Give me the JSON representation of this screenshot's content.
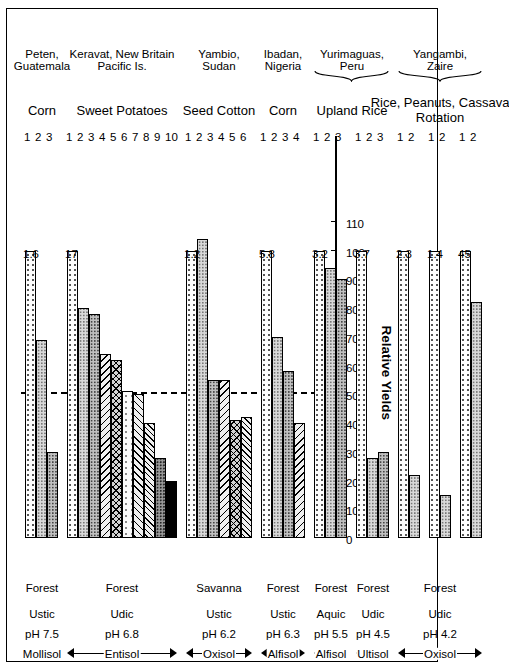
{
  "chart_data": {
    "type": "bar",
    "title": "",
    "xlabel": "",
    "ylabel": "Relative Yields",
    "ylim": [
      0,
      110
    ],
    "yticks": [
      0,
      10,
      20,
      30,
      40,
      50,
      60,
      70,
      80,
      90,
      100,
      110
    ],
    "grid": false,
    "legend": "none",
    "orientation": "rotated-90-ccw",
    "reference_line": {
      "value": 50,
      "style": "dashed",
      "label": ""
    },
    "groups": [
      {
        "crop": "Corn",
        "site": "Peten,\nGuatemala",
        "site_line1": "Peten,",
        "site_line2": "Guatemala",
        "first_crop_yield": "1.6",
        "categories": [
          "1",
          "2",
          "3"
        ],
        "values": [
          100,
          69,
          30
        ],
        "patterns": [
          "dots",
          "grey1",
          "grey2"
        ],
        "soil": {
          "name": "Mollisol",
          "ph": "pH 7.5",
          "moisture": "Ustic",
          "vegetation": "Forest"
        }
      },
      {
        "crop": "Sweet Potatoes",
        "site": "Keravat, New Britain\nPacific Is.",
        "site_line1": "Keravat, New Britain",
        "site_line2": "Pacific Is.",
        "first_crop_yield": "17",
        "categories": [
          "1",
          "2",
          "3",
          "4",
          "5",
          "6",
          "7",
          "8",
          "9",
          "10"
        ],
        "values": [
          100,
          80,
          78,
          64,
          62,
          51,
          50,
          40,
          28,
          20
        ],
        "patterns": [
          "dots",
          "grey1",
          "grey2",
          "diag",
          "cross",
          "lightdot",
          "diag2",
          "zig",
          "grey3",
          "black"
        ],
        "soil": {
          "name": "Entisol",
          "ph": "pH 6.8",
          "moisture": "Udic",
          "vegetation": "Forest"
        }
      },
      {
        "crop": "Seed Cotton",
        "site": "Yambio,\nSudan",
        "site_line1": "Yambio,",
        "site_line2": "Sudan",
        "first_crop_yield": "1.2",
        "categories": [
          "1",
          "2",
          "3",
          "4",
          "5",
          "6"
        ],
        "values": [
          100,
          104,
          55,
          55,
          41,
          42
        ],
        "patterns": [
          "dots",
          "grey1",
          "grey2",
          "diag",
          "cross",
          "zig"
        ],
        "soil": {
          "name": "Oxisol",
          "ph": "pH 6.2",
          "moisture": "Ustic",
          "vegetation": "Savanna"
        }
      },
      {
        "crop": "Corn",
        "site": "Ibadan,\nNigeria",
        "site_line1": "Ibadan,",
        "site_line2": "Nigeria",
        "first_crop_yield": "5.8",
        "categories": [
          "1",
          "2",
          "3",
          "4"
        ],
        "values": [
          100,
          70,
          58,
          40
        ],
        "patterns": [
          "dots",
          "grey1",
          "grey2",
          "diag"
        ],
        "soil": {
          "name": "Alfisol",
          "ph": "pH 6.3",
          "moisture": "Ustic",
          "vegetation": "Forest"
        }
      },
      {
        "crop": "Upland Rice",
        "site": "Yurimaguas,\nPeru",
        "site_line1": "Yurimaguas,",
        "site_line2": "Peru",
        "first_crop_yield": "3.2",
        "categories": [
          "1",
          "2",
          "3"
        ],
        "values": [
          100,
          94,
          90
        ],
        "patterns": [
          "dots",
          "grey1",
          "grey2"
        ],
        "soil": {
          "name": "Alfisol",
          "ph": "pH 5.5",
          "moisture": "Aquic",
          "vegetation": "Forest"
        }
      },
      {
        "crop": "Upland Rice",
        "site": "Yurimaguas,\nPeru",
        "site_line1": "",
        "site_line2": "",
        "first_crop_yield": "3.7",
        "categories": [
          "1",
          "2",
          "3"
        ],
        "values": [
          100,
          28,
          30
        ],
        "patterns": [
          "dots",
          "grey1",
          "grey2"
        ],
        "soil": {
          "name": "Ultisol",
          "ph": "pH 4.5",
          "moisture": "Udic",
          "vegetation": "Forest"
        }
      },
      {
        "crop": "Rice, Peanuts, Cassava Rotation",
        "site": "Yangambi,\nZaire",
        "site_line1": "Yangambi,",
        "site_line2": "Zaire",
        "first_crop_yield": "2.3",
        "categories": [
          "1",
          "2"
        ],
        "values": [
          100,
          22
        ],
        "patterns": [
          "dots",
          "grey1"
        ],
        "soil": {
          "name": "Oxisol",
          "ph": "pH 4.2",
          "moisture": "Udic",
          "vegetation": "Forest"
        }
      },
      {
        "crop": "",
        "site": "",
        "site_line1": "",
        "site_line2": "",
        "first_crop_yield": "1.4",
        "categories": [
          "1",
          "2"
        ],
        "values": [
          100,
          15
        ],
        "patterns": [
          "dots",
          "grey1"
        ],
        "soil": {
          "name": "",
          "ph": "",
          "moisture": "",
          "vegetation": ""
        }
      },
      {
        "crop": "",
        "site": "",
        "site_line1": "",
        "site_line2": "",
        "first_crop_yield": "45",
        "categories": [
          "1",
          "2"
        ],
        "values": [
          100,
          82
        ],
        "patterns": [
          "dots",
          "grey1"
        ],
        "soil": {
          "name": "",
          "ph": "",
          "moisture": "",
          "vegetation": ""
        }
      }
    ],
    "soil_bands": [
      {
        "name": "Mollisol",
        "ph": "pH 7.5",
        "moisture": "Ustic",
        "vegetation": "Forest"
      },
      {
        "name": "Entisol",
        "ph": "pH 6.8",
        "moisture": "Udic",
        "vegetation": "Forest"
      },
      {
        "name": "Oxisol",
        "ph": "pH 6.2",
        "moisture": "Ustic",
        "vegetation": "Savanna"
      },
      {
        "name": "Alfisol",
        "ph": "pH 6.3",
        "moisture": "Ustic",
        "vegetation": "Forest"
      },
      {
        "name": "Alfisol",
        "ph": "pH 5.5",
        "moisture": "Aquic",
        "vegetation": "Forest"
      },
      {
        "name": "Ultisol",
        "ph": "pH 4.5",
        "moisture": "Udic",
        "vegetation": "Forest"
      },
      {
        "name": "Oxisol",
        "ph": "pH 4.2",
        "moisture": "Udic",
        "vegetation": "Forest"
      }
    ],
    "crop_labels": [
      "Corn",
      "Sweet Potatoes",
      "Seed Cotton",
      "Corn",
      "Upland Rice",
      "Rice, Peanuts, Cassava Rotation"
    ],
    "site_labels": [
      "Peten, Guatemala",
      "Keravat, New Britain Pacific Is.",
      "Yambio, Sudan",
      "Ibadan, Nigeria",
      "Yurimaguas, Peru",
      "Yangambi, Zaire"
    ]
  }
}
